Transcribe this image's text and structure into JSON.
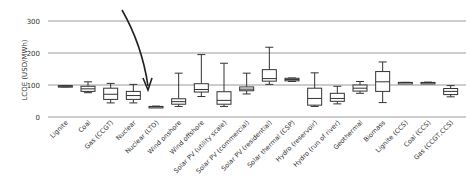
{
  "chart_data": {
    "type": "box",
    "title": "",
    "xlabel": "",
    "ylabel": "LCOE (USD/MWh)",
    "ylim": [
      0,
      300
    ],
    "yticks": [
      0,
      100,
      200,
      300
    ],
    "grid": true,
    "legend": null,
    "annotation": {
      "type": "arrow",
      "points_to": "Nuclear (LTO)"
    },
    "categories": [
      "Lignite",
      "Coal",
      "Gas (CCGT)",
      "Nuclear",
      "Nuclear (LTO)",
      "Wind onshore",
      "Wind offshore",
      "Solar PV (utility scale)",
      "Solar PV (commercial)",
      "Solar PV (residential)",
      "Solar thermal (CSP)",
      "Hydro (reservoir)",
      "Hydro (run of river)",
      "Geothermal",
      "Biomass",
      "Lignite (CCS)",
      "Coal (CCS)",
      "Gas (CCGT,CCS)"
    ],
    "series": [
      {
        "name": "LCOE",
        "boxes": [
          {
            "min": 94,
            "q1": 94,
            "median": 96,
            "q3": 98,
            "max": 98
          },
          {
            "min": 76,
            "q1": 80,
            "median": 88,
            "q3": 96,
            "max": 110
          },
          {
            "min": 44,
            "q1": 55,
            "median": 71,
            "q3": 90,
            "max": 105
          },
          {
            "min": 44,
            "q1": 55,
            "median": 67,
            "q3": 80,
            "max": 102
          },
          {
            "min": 30,
            "q1": 31,
            "median": 32,
            "q3": 33,
            "max": 34
          },
          {
            "min": 33,
            "q1": 40,
            "median": 48,
            "q3": 57,
            "max": 137
          },
          {
            "min": 64,
            "q1": 78,
            "median": 86,
            "q3": 104,
            "max": 195
          },
          {
            "min": 33,
            "q1": 40,
            "median": 52,
            "q3": 79,
            "max": 168
          },
          {
            "min": 72,
            "q1": 82,
            "median": 87,
            "q3": 94,
            "max": 137
          },
          {
            "min": 102,
            "q1": 112,
            "median": 120,
            "q3": 148,
            "max": 218
          },
          {
            "min": 111,
            "q1": 113,
            "median": 117,
            "q3": 121,
            "max": 122
          },
          {
            "min": 33,
            "q1": 37,
            "median": 58,
            "q3": 90,
            "max": 138
          },
          {
            "min": 41,
            "q1": 49,
            "median": 58,
            "q3": 74,
            "max": 96
          },
          {
            "min": 74,
            "q1": 81,
            "median": 90,
            "q3": 100,
            "max": 111
          },
          {
            "min": 45,
            "q1": 80,
            "median": 110,
            "q3": 142,
            "max": 172
          },
          {
            "min": 108,
            "q1": 108,
            "median": 108,
            "q3": 108,
            "max": 108
          },
          {
            "min": 105,
            "q1": 106,
            "median": 107,
            "q3": 108,
            "max": 109
          },
          {
            "min": 63,
            "q1": 70,
            "median": 80,
            "q3": 89,
            "max": 98
          }
        ]
      }
    ]
  },
  "axis": {
    "ylabel": "LCOE (USD/MWh)",
    "ticks": [
      "0",
      "100",
      "200",
      "300"
    ]
  }
}
